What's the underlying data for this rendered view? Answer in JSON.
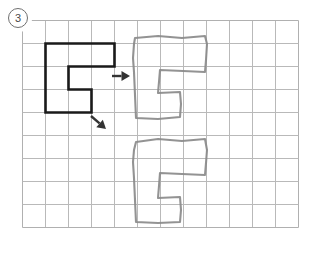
{
  "page": {
    "background_color": "#ffffff",
    "width": 319,
    "height": 256,
    "problem_number": "3",
    "problem_number_display": "3"
  },
  "grid": {
    "name": "graph-paper-grid",
    "origin_x": 22,
    "origin_y": 20,
    "cell_size": 23,
    "cols": 12,
    "rows": 9,
    "line_color": "#b9b9b9",
    "line_width": 1,
    "border_color": "#b0b0b0"
  },
  "shapes": {
    "reference": {
      "name": "reference-shape",
      "label": "bold printed C shape",
      "stroke_color": "#1a1a1a",
      "stroke_width": 2.6,
      "fill": "none",
      "grid_points": [
        [
          1,
          1
        ],
        [
          4,
          1
        ],
        [
          4,
          2
        ],
        [
          2,
          2
        ],
        [
          2,
          3
        ],
        [
          3,
          3
        ],
        [
          3,
          4
        ],
        [
          1,
          4
        ]
      ],
      "closed": true
    },
    "drawn_top": {
      "name": "hand-drawn-shape-top",
      "label": "pencil copy upper",
      "stroke_color": "#8a8a8a",
      "stroke_width": 2.1,
      "fill": "none",
      "points": [
        [
          135,
          38
        ],
        [
          158,
          36
        ],
        [
          182,
          38
        ],
        [
          205,
          36
        ],
        [
          207,
          44
        ],
        [
          206,
          60
        ],
        [
          205,
          72
        ],
        [
          183,
          71
        ],
        [
          160,
          70
        ],
        [
          159,
          82
        ],
        [
          158,
          93
        ],
        [
          180,
          92
        ],
        [
          181,
          104
        ],
        [
          180,
          117
        ],
        [
          158,
          119
        ],
        [
          136,
          118
        ],
        [
          135,
          95
        ],
        [
          134,
          72
        ],
        [
          133,
          58
        ],
        [
          134,
          44
        ]
      ],
      "closed": true
    },
    "drawn_bottom": {
      "name": "hand-drawn-shape-bottom",
      "label": "pencil copy lower",
      "stroke_color": "#8a8a8a",
      "stroke_width": 2.1,
      "fill": "none",
      "points": [
        [
          136,
          142
        ],
        [
          158,
          139
        ],
        [
          182,
          141
        ],
        [
          205,
          139
        ],
        [
          207,
          150
        ],
        [
          206,
          163
        ],
        [
          205,
          175
        ],
        [
          182,
          174
        ],
        [
          160,
          173
        ],
        [
          159,
          186
        ],
        [
          158,
          198
        ],
        [
          180,
          197
        ],
        [
          181,
          210
        ],
        [
          180,
          222
        ],
        [
          158,
          223
        ],
        [
          136,
          222
        ],
        [
          135,
          200
        ],
        [
          134,
          178
        ],
        [
          133,
          162
        ],
        [
          134,
          150
        ]
      ],
      "closed": true
    }
  },
  "arrows": {
    "right_arrow": {
      "name": "right-arrow",
      "label": "arrow pointing right",
      "color": "#333333",
      "x1": 112,
      "y1": 76,
      "x2": 130,
      "y2": 76,
      "head_size": 5
    },
    "diagonal_arrow": {
      "name": "diagonal-down-right-arrow",
      "label": "arrow pointing down-right",
      "color": "#333333",
      "x1": 91,
      "y1": 116,
      "x2": 106,
      "y2": 129,
      "head_size": 5
    }
  }
}
